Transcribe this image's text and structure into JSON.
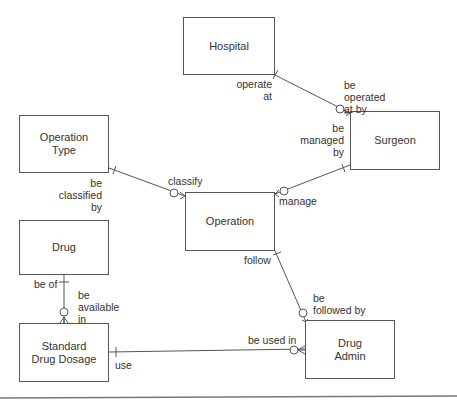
{
  "entities": {
    "hospital": "Hospital",
    "surgeon": "Surgeon",
    "operation_type": "Operation\nType",
    "operation": "Operation",
    "drug": "Drug",
    "standard_drug_dosage": "Standard\nDrug Dosage",
    "drug_admin": "Drug\nAdmin"
  },
  "relationships": {
    "operate_at": "operate\nat",
    "be_operated_at_by": "be\noperated\nat by",
    "be_managed_by": "be\nmanaged\nby",
    "manage": "manage",
    "be_classified_by": "be\nclassified\nby",
    "classify": "classify",
    "follow": "follow",
    "be_followed_by": "be\nfollowed by",
    "be_of": "be of",
    "be_available_in": "be\navailable\nin",
    "use": "use",
    "be_used_in": "be used in"
  },
  "colors": {
    "line": "#555555",
    "text": "#333333"
  }
}
